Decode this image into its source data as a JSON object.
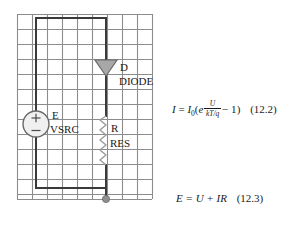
{
  "figure": {
    "type": "circuit-schematic-with-equations",
    "background_color": "#ffffff",
    "grid": {
      "line_color": "#8c8c8c",
      "cell_size_px": 15,
      "columns": 9,
      "rows": 12,
      "left_px": 17,
      "top_px": 14,
      "right_px": 152,
      "bottom_px": 199
    },
    "wire_color": "#3a3a3a",
    "component_fill": "#a8a8a8"
  },
  "schematic": {
    "components": [
      {
        "id": "voltage-source",
        "icon": "voltage-source-icon",
        "label_primary": "E",
        "label_secondary": "VSRC",
        "terminal_plus": "+",
        "terminal_minus": "−",
        "center_x": 36,
        "center_y": 124,
        "radius": 13
      },
      {
        "id": "diode",
        "icon": "diode-icon",
        "label_primary": "D",
        "label_secondary": "DIODE",
        "x": 106,
        "y": 67
      },
      {
        "id": "resistor",
        "icon": "resistor-zigzag-icon",
        "label_primary": "R",
        "label_secondary": "RES",
        "x": 106,
        "y": 140
      },
      {
        "id": "ground-node",
        "icon": "node-dot-icon",
        "label_primary": "",
        "x": 106,
        "y": 199
      }
    ]
  },
  "equations": {
    "diode": {
      "lhs_I": "I",
      "equals": "=",
      "I0_base": "I",
      "I0_sub": "0",
      "open_paren": "(",
      "exp_base": "e",
      "exp_numerator": "U",
      "exp_denominator": "kT/q",
      "minus_one": "− 1",
      "close_paren": ")",
      "number": "(12.2)"
    },
    "kvl": {
      "text": "E = U + IR",
      "number": "(12.3)"
    }
  }
}
